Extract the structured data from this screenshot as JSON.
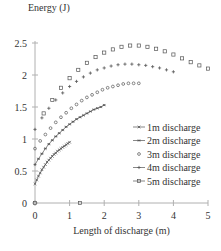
{
  "chart_data": {
    "type": "scatter",
    "title": "",
    "xlabel": "Length of discharge (m)",
    "ylabel": "Energy (J)",
    "xlim": [
      0,
      5
    ],
    "ylim": [
      0,
      2.5
    ],
    "xticks": [
      "0",
      "1",
      "2",
      "3",
      "4",
      "5"
    ],
    "yticks": [
      "0",
      "0.5",
      "1",
      "1.5",
      "2",
      "2.5"
    ],
    "grid": false,
    "legend_position": "lower right (inside)",
    "series": [
      {
        "name": "1m discharge",
        "marker": "x-line",
        "x": [
          0.0,
          0.05,
          0.1,
          0.15,
          0.2,
          0.25,
          0.3,
          0.35,
          0.4,
          0.45,
          0.5,
          0.55,
          0.6,
          0.65,
          0.7,
          0.75,
          0.8,
          0.85,
          0.9,
          0.95,
          1.0
        ],
        "y": [
          0.3,
          0.36,
          0.42,
          0.47,
          0.52,
          0.56,
          0.6,
          0.64,
          0.67,
          0.7,
          0.73,
          0.76,
          0.78,
          0.81,
          0.83,
          0.85,
          0.87,
          0.89,
          0.91,
          0.93,
          0.95
        ]
      },
      {
        "name": "2m discharge",
        "marker": "asterisk-line",
        "x": [
          0.0,
          0.1,
          0.2,
          0.3,
          0.4,
          0.5,
          0.6,
          0.7,
          0.8,
          0.9,
          1.0,
          1.1,
          1.2,
          1.3,
          1.4,
          1.5,
          1.6,
          1.7,
          1.8,
          1.9,
          2.0
        ],
        "y": [
          0.6,
          0.69,
          0.77,
          0.85,
          0.92,
          0.98,
          1.04,
          1.09,
          1.14,
          1.19,
          1.23,
          1.27,
          1.31,
          1.34,
          1.37,
          1.4,
          1.43,
          1.46,
          1.48,
          1.5,
          1.53
        ]
      },
      {
        "name": "3m discharge",
        "marker": "circle",
        "x": [
          0.0,
          0.15,
          0.3,
          0.45,
          0.6,
          0.75,
          0.9,
          1.05,
          1.2,
          1.35,
          1.5,
          1.65,
          1.8,
          1.95,
          2.1,
          2.25,
          2.4,
          2.55,
          2.7,
          2.85,
          3.0
        ],
        "y": [
          0.85,
          0.97,
          1.07,
          1.17,
          1.26,
          1.34,
          1.41,
          1.48,
          1.54,
          1.6,
          1.65,
          1.69,
          1.73,
          1.77,
          1.8,
          1.82,
          1.84,
          1.86,
          1.87,
          1.87,
          1.87
        ]
      },
      {
        "name": "4m discharge",
        "marker": "plus-line",
        "x": [
          0.0,
          0.2,
          0.4,
          0.6,
          0.8,
          1.0,
          1.2,
          1.4,
          1.6,
          1.8,
          2.0,
          2.2,
          2.4,
          2.6,
          2.8,
          3.0,
          3.2,
          3.4,
          3.6,
          3.8,
          4.0
        ],
        "y": [
          1.15,
          1.33,
          1.48,
          1.61,
          1.72,
          1.82,
          1.9,
          1.97,
          2.03,
          2.08,
          2.11,
          2.14,
          2.16,
          2.17,
          2.17,
          2.16,
          2.15,
          2.13,
          2.11,
          2.08,
          2.05
        ]
      },
      {
        "name": "5m discharge",
        "marker": "square-line",
        "x": [
          0.0,
          0.25,
          0.5,
          0.75,
          1.0,
          1.25,
          1.5,
          1.75,
          2.0,
          2.25,
          2.5,
          2.75,
          3.0,
          3.25,
          3.5,
          3.75,
          4.0,
          4.25,
          4.5,
          4.75,
          5.0,
          1.3
        ],
        "y": [
          0.0,
          1.4,
          1.61,
          1.8,
          1.95,
          2.08,
          2.19,
          2.28,
          2.35,
          2.4,
          2.44,
          2.46,
          2.46,
          2.44,
          2.41,
          2.37,
          2.32,
          2.26,
          2.2,
          2.15,
          2.1,
          0.0
        ]
      }
    ]
  },
  "axes": {
    "ylabel": "Energy (J)",
    "xlabel": "Length of discharge (m)"
  },
  "legend": [
    {
      "label": "1m discharge"
    },
    {
      "label": "2m discharge"
    },
    {
      "label": "3m discharge"
    },
    {
      "label": "4m discharge"
    },
    {
      "label": "5m discharge"
    }
  ]
}
